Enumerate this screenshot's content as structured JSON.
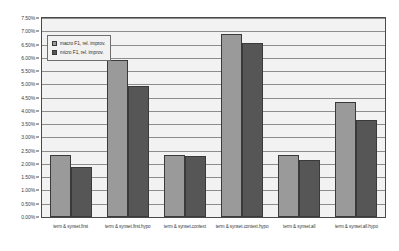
{
  "chart_data": {
    "type": "bar",
    "title": "",
    "xlabel": "",
    "ylabel": "",
    "ylim": [
      0,
      7.5
    ],
    "grid": true,
    "legend_position": "top-left inside plot",
    "y_tick_labels": [
      "7.50%",
      "7.00%",
      "6.50%",
      "6.00%",
      "5.50%",
      "5.00%",
      "4.50%",
      "4.00%",
      "3.50%",
      "3.00%",
      "2.50%",
      "2.00%",
      "1.50%",
      "1.00%",
      "0.50%",
      "0.00%"
    ],
    "y_tick_values": [
      7.5,
      7.0,
      6.5,
      6.0,
      5.5,
      5.0,
      4.5,
      4.0,
      3.5,
      3.0,
      2.5,
      2.0,
      1.5,
      1.0,
      0.5,
      0.0
    ],
    "categories": [
      "term & synset.first",
      "term & synset.first.hypo",
      "term & synset.context",
      "term & synset.context.hypo",
      "term & synset.all",
      "term & synset.all.hypo"
    ],
    "series": [
      {
        "name": "macro F1, rel. improv.",
        "color": "#9a9a9a",
        "values": [
          2.35,
          5.9,
          2.35,
          6.9,
          2.35,
          4.35
        ]
      },
      {
        "name": "micro F1, rel. improv.",
        "color": "#565656",
        "values": [
          1.9,
          4.95,
          2.3,
          6.55,
          2.15,
          3.65
        ]
      }
    ]
  },
  "colors": {
    "macro_series": "#9a9a9a",
    "micro_series": "#565656",
    "plot_background": "#f2f2f2",
    "gridline": "#8d8d8d",
    "axis_line": "#4a4a4a",
    "page_background": "#ffffff"
  }
}
